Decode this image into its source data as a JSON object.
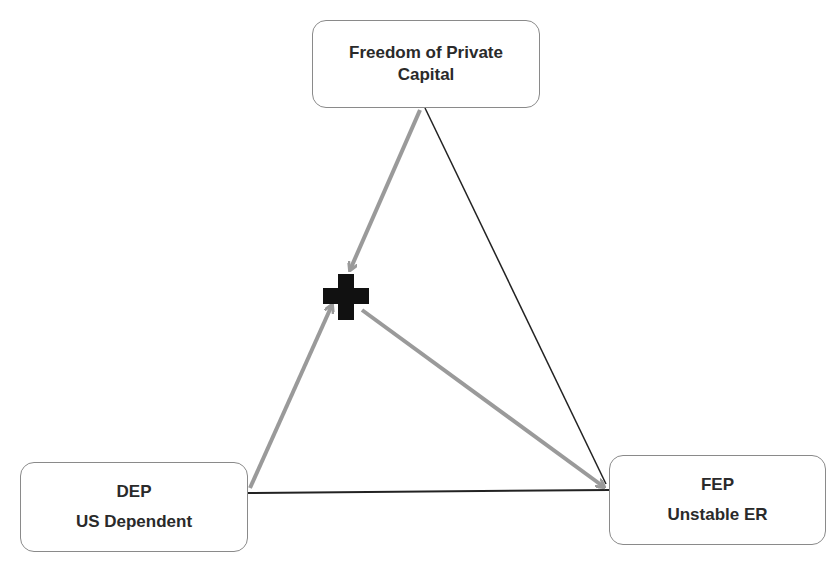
{
  "diagram": {
    "type": "trilemma-triangle",
    "nodes": {
      "top": {
        "lines": [
          "Freedom of Private",
          "Capital"
        ]
      },
      "left": {
        "lines": [
          "DEP",
          "US Dependent"
        ]
      },
      "right": {
        "lines": [
          "FEP",
          "Unstable ER"
        ]
      }
    },
    "center_marker": {
      "icon": "plus-icon",
      "color": "#111111"
    },
    "edges": [
      {
        "from": "top",
        "to": "right",
        "style": "thin-black"
      },
      {
        "from": "left",
        "to": "right",
        "style": "thin-black"
      },
      {
        "from": "top",
        "to": "center",
        "style": "gray-arrow"
      },
      {
        "from": "left",
        "to": "center",
        "style": "gray-arrow"
      },
      {
        "from": "center",
        "to": "right",
        "style": "gray-arrow"
      }
    ],
    "colors": {
      "arrow": "#9a9a9a",
      "line": "#222222",
      "border": "#8a8a8a"
    }
  }
}
